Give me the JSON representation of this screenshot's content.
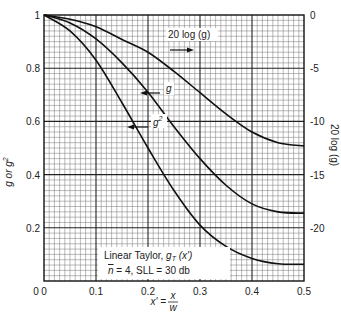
{
  "chart_data": {
    "type": "line",
    "title": "",
    "xlabel": "x' = x / w",
    "xlabel_parts": {
      "lhs": "x'",
      "eq": "=",
      "num": "x",
      "den": "w"
    },
    "ylabel_left": "g or g²",
    "ylabel_right": "20 log (g)",
    "xlim": [
      0,
      0.5
    ],
    "ylim_left": [
      0,
      1
    ],
    "ylim_right": [
      -25,
      0
    ],
    "x_ticks": [
      "0",
      "0.1",
      "0.2",
      "0.3",
      "0.4",
      "0.5"
    ],
    "y_ticks_left": [
      "0.2",
      "0.4",
      "0.6",
      "0.8",
      "1"
    ],
    "y_ticks_right": [
      "0",
      "-5",
      "-10",
      "-15",
      "-20"
    ],
    "grid": true,
    "x": [
      0,
      0.05,
      0.1,
      0.15,
      0.2,
      0.25,
      0.3,
      0.35,
      0.4,
      0.45,
      0.5
    ],
    "series": [
      {
        "name": "20 log (g)",
        "axis": "right",
        "values": [
          0,
          -0.4,
          -1.1,
          -2.3,
          -3.5,
          -5.3,
          -7.3,
          -9.3,
          -11.0,
          -12.0,
          -12.3
        ]
      },
      {
        "name": "g",
        "axis": "left",
        "values": [
          1.0,
          0.97,
          0.91,
          0.82,
          0.71,
          0.58,
          0.46,
          0.36,
          0.29,
          0.26,
          0.255
        ]
      },
      {
        "name": "g²",
        "axis": "left",
        "values": [
          1.0,
          0.94,
          0.83,
          0.67,
          0.5,
          0.34,
          0.21,
          0.13,
          0.085,
          0.065,
          0.063
        ]
      }
    ],
    "annotations": [
      {
        "text": "20 log (g)",
        "arrow": "right"
      },
      {
        "text": "g",
        "arrow": "left"
      },
      {
        "text": "g²",
        "arrow": "left"
      }
    ],
    "legend_box": {
      "line1": "Linear Taylor, gT (x')",
      "line2": "n̄ = 4, SLL = 30 db"
    }
  },
  "labels": {
    "x_axis": "x' =",
    "x_num": "x",
    "x_den": "w",
    "y_left": "g or g",
    "y_left_sup": "2",
    "y_right": "20 log (g)",
    "ann_db": "20 log (g)",
    "ann_g": "g",
    "ann_g2": "g",
    "ann_g2_sup": "2",
    "box_line1_a": "Linear Taylor, ",
    "box_line1_g": "g",
    "box_line1_sub": "T",
    "box_line1_b": " (x')",
    "box_line2_n": "n",
    "box_line2_rest": " = 4, SLL = 30 db"
  }
}
